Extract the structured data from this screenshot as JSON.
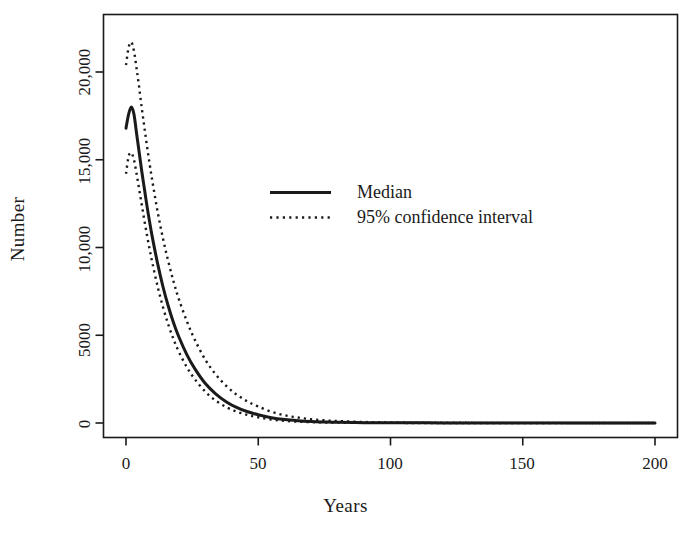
{
  "chart_data": {
    "type": "line",
    "title": "",
    "xlabel": "Years",
    "ylabel": "Number",
    "xlim": [
      0,
      200
    ],
    "ylim": [
      0,
      22500
    ],
    "grid": false,
    "xticks": [
      0,
      50,
      100,
      150,
      200
    ],
    "xticklabels": [
      "0",
      "50",
      "100",
      "150",
      "200"
    ],
    "yticks": [
      0,
      5000,
      10000,
      15000,
      20000
    ],
    "yticklabels": [
      "0",
      "5000",
      "10,000",
      "15,000",
      "20,000"
    ],
    "legend_position": "center",
    "legend": [
      {
        "label": "Median",
        "style": "solid"
      },
      {
        "label": "95% confidence interval",
        "style": "dotted"
      }
    ],
    "series": [
      {
        "name": "Median",
        "style": "solid",
        "x": [
          0,
          1,
          2,
          3,
          4,
          5,
          6,
          7,
          8,
          9,
          10,
          12,
          14,
          16,
          18,
          20,
          23,
          26,
          30,
          34,
          38,
          42,
          46,
          50,
          55,
          60,
          65,
          70,
          75,
          80,
          90,
          100,
          120,
          140,
          160,
          180,
          200
        ],
        "y": [
          16800,
          17600,
          18000,
          17600,
          16500,
          15400,
          14300,
          13300,
          12300,
          11400,
          10550,
          9050,
          7750,
          6650,
          5700,
          4900,
          3900,
          3100,
          2250,
          1650,
          1200,
          870,
          640,
          470,
          300,
          195,
          130,
          85,
          60,
          40,
          20,
          12,
          6,
          4,
          3,
          2,
          2
        ]
      },
      {
        "name": "95% upper confidence limit",
        "style": "dotted",
        "x": [
          0,
          1,
          2,
          3,
          4,
          5,
          6,
          7,
          8,
          9,
          10,
          12,
          14,
          16,
          18,
          20,
          23,
          26,
          30,
          34,
          38,
          42,
          46,
          50,
          55,
          60,
          65,
          70,
          75,
          80,
          90,
          100,
          120,
          140,
          160,
          180,
          200
        ],
        "y": [
          20400,
          21400,
          21700,
          21200,
          20200,
          19100,
          17900,
          16800,
          15700,
          14700,
          13750,
          12000,
          10500,
          9200,
          8050,
          7050,
          5800,
          4750,
          3600,
          2750,
          2100,
          1600,
          1220,
          940,
          640,
          440,
          310,
          215,
          155,
          110,
          58,
          32,
          14,
          8,
          5,
          3,
          2
        ]
      },
      {
        "name": "95% lower confidence limit",
        "style": "dotted",
        "x": [
          0,
          1,
          2,
          3,
          4,
          5,
          6,
          7,
          8,
          9,
          10,
          12,
          14,
          16,
          18,
          20,
          23,
          26,
          30,
          34,
          38,
          42,
          46,
          50,
          55,
          60,
          65,
          70,
          75,
          80,
          90,
          100,
          120,
          140,
          160,
          180,
          200
        ],
        "y": [
          14200,
          15200,
          15400,
          15000,
          14200,
          13300,
          12400,
          11500,
          10650,
          9850,
          9100,
          7750,
          6600,
          5600,
          4760,
          4050,
          3180,
          2500,
          1780,
          1270,
          900,
          640,
          455,
          325,
          200,
          125,
          78,
          50,
          32,
          21,
          9,
          5,
          2,
          1,
          1,
          1,
          1
        ]
      }
    ]
  },
  "axes": {
    "ylabel": "Number",
    "xlabel": "Years"
  },
  "legend": {
    "median_label": "Median",
    "ci_label": "95% confidence interval"
  }
}
